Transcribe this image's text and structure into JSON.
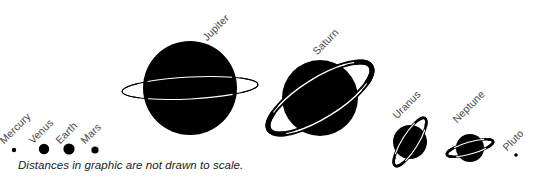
{
  "graphic": {
    "title": "Solar System Planet Size Comparison",
    "background_color": "#ffffff",
    "body_color": "#000000",
    "ring_color": "#000000",
    "ring_highlight_color": "#ffffff",
    "label_color": "#4a4a4a",
    "caption_color": "#1a1a1a",
    "width": 548,
    "height": 181
  },
  "caption": {
    "text": "Distances in graphic are not drawn to scale."
  },
  "planets": [
    {
      "name": "Mercury",
      "label": "Mercury",
      "cx": 14,
      "cy": 150,
      "r": 2.2,
      "has_ring": false,
      "label_x": 5,
      "label_y": 135,
      "label_rotate": -45
    },
    {
      "name": "Venus",
      "label": "Venus",
      "cx": 44,
      "cy": 149,
      "r": 5.2,
      "has_ring": false,
      "label_x": 34,
      "label_y": 135,
      "label_rotate": -45
    },
    {
      "name": "Earth",
      "label": "Earth",
      "cx": 69,
      "cy": 149,
      "r": 5.6,
      "has_ring": false,
      "label_x": 61,
      "label_y": 135,
      "label_rotate": -45
    },
    {
      "name": "Mars",
      "label": "Mars",
      "cx": 95,
      "cy": 150,
      "r": 3.6,
      "has_ring": false,
      "label_x": 86,
      "label_y": 135,
      "label_rotate": -45
    },
    {
      "name": "Jupiter",
      "label": "Jupiter",
      "cx": 190,
      "cy": 88,
      "r": 47,
      "has_ring": true,
      "ring_rx": 68,
      "ring_ry": 11,
      "ring_rotate": -3,
      "ring_weight": "thin",
      "label_x": 208,
      "label_y": 32,
      "label_rotate": -45
    },
    {
      "name": "Saturn",
      "label": "Saturn",
      "cx": 320,
      "cy": 98,
      "r": 38,
      "has_ring": true,
      "ring_rx": 60,
      "ring_ry": 20,
      "ring_rotate": -32,
      "ring_weight": "thick",
      "label_x": 318,
      "label_y": 46,
      "label_rotate": -45
    },
    {
      "name": "Uranus",
      "label": "Uranus",
      "cx": 410,
      "cy": 142,
      "r": 17,
      "has_ring": true,
      "ring_rx": 28,
      "ring_ry": 8,
      "ring_rotate": -58,
      "ring_weight": "medium",
      "label_x": 398,
      "label_y": 110,
      "label_rotate": -45
    },
    {
      "name": "Neptune",
      "label": "Neptune",
      "cx": 470,
      "cy": 148,
      "r": 14,
      "has_ring": true,
      "ring_rx": 24,
      "ring_ry": 6,
      "ring_rotate": -16,
      "ring_weight": "medium",
      "label_x": 458,
      "label_y": 114,
      "label_rotate": -45
    },
    {
      "name": "Pluto",
      "label": "Pluto",
      "cx": 516,
      "cy": 155,
      "r": 1.8,
      "has_ring": false,
      "label_x": 508,
      "label_y": 142,
      "label_rotate": -45
    }
  ]
}
